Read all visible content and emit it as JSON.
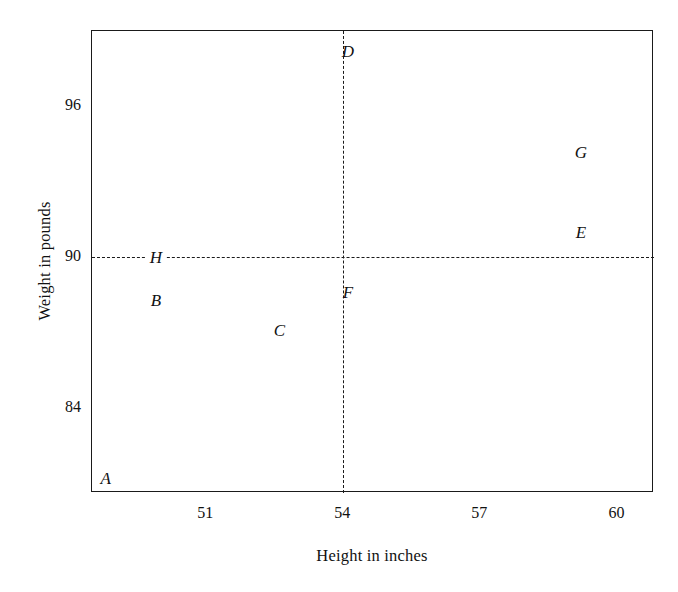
{
  "chart_data": {
    "type": "scatter",
    "title": "",
    "xlabel": "Height in inches",
    "ylabel": "Weight in pounds",
    "xlim": [
      48.5,
      60.8
    ],
    "ylim": [
      80.6,
      99.0
    ],
    "grid": false,
    "legend": "none",
    "x_ticks": [
      {
        "value": 49.0,
        "label": "",
        "major": false
      },
      {
        "value": 50.0,
        "label": "",
        "major": false
      },
      {
        "value": 51.0,
        "label": "51",
        "major": false
      },
      {
        "value": 52.0,
        "label": "",
        "major": false
      },
      {
        "value": 53.0,
        "label": "",
        "major": false
      },
      {
        "value": 54.0,
        "label": "54",
        "major": true
      },
      {
        "value": 55.0,
        "label": "",
        "major": false
      },
      {
        "value": 56.0,
        "label": "",
        "major": false
      },
      {
        "value": 57.0,
        "label": "57",
        "major": false
      },
      {
        "value": 58.0,
        "label": "",
        "major": false
      },
      {
        "value": 59.0,
        "label": "",
        "major": false
      },
      {
        "value": 60.0,
        "label": "60",
        "major": false
      }
    ],
    "y_ticks": [
      {
        "value": 96,
        "label": "96"
      },
      {
        "value": 90,
        "label": "90"
      },
      {
        "value": 84,
        "label": "84"
      }
    ],
    "reference_lines": [
      {
        "orientation": "horizontal",
        "value": 90,
        "style": "dashed"
      },
      {
        "orientation": "vertical",
        "value": 54,
        "style": "dashed"
      }
    ],
    "points": [
      {
        "label": "A",
        "x": 48.8,
        "y": 81.2
      },
      {
        "label": "B",
        "x": 49.9,
        "y": 88.3
      },
      {
        "label": "C",
        "x": 52.6,
        "y": 87.1
      },
      {
        "label": "D",
        "x": 54.1,
        "y": 98.2
      },
      {
        "label": "E",
        "x": 59.2,
        "y": 91.0
      },
      {
        "label": "F",
        "x": 54.1,
        "y": 88.6
      },
      {
        "label": "G",
        "x": 59.2,
        "y": 94.2
      },
      {
        "label": "H",
        "x": 49.9,
        "y": 90.0
      }
    ]
  },
  "colors": {
    "frame": "#1a1a1a",
    "text": "#111111",
    "background": "#ffffff",
    "dashed": "#1a1a1a"
  }
}
